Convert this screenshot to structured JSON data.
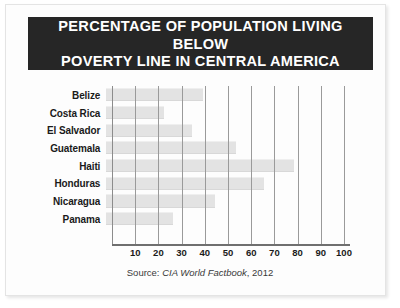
{
  "title": {
    "line1": "PERCENTAGE OF POPULATION LIVING BELOW",
    "line2": "POVERTY LINE IN CENTRAL AMERICA",
    "full": "PERCENTAGE OF POPULATION LIVING BELOW\nPOVERTY LINE IN CENTRAL AMERICA",
    "background_color": "#262626",
    "text_color": "#ffffff"
  },
  "source": {
    "label": "Source: ",
    "publication": "CIA World Factbook",
    "year": ", 2012",
    "full": "Source: CIA World Factbook, 2012"
  },
  "colors": {
    "bar_fill": "#e3e3e3",
    "gridline": "#9a9a9a",
    "axis": "#6f6f6f",
    "page_background": "#fdfdfd",
    "frame_border": "#e4e4e4"
  },
  "chart_data": {
    "type": "bar",
    "orientation": "horizontal",
    "title": "PERCENTAGE OF POPULATION LIVING BELOW POVERTY LINE IN CENTRAL AMERICA",
    "xlabel": "",
    "ylabel": "",
    "categories": [
      "Belize",
      "Costa Rica",
      "El Salvador",
      "Guatemala",
      "Haiti",
      "Honduras",
      "Nicaragua",
      "Panama"
    ],
    "values": [
      42,
      25,
      37,
      56,
      81,
      68,
      47,
      29
    ],
    "xlim": [
      0,
      100
    ],
    "xticks": [
      10,
      20,
      30,
      40,
      50,
      60,
      70,
      80,
      90,
      100
    ],
    "xtick_labels": [
      "10",
      "20",
      "30",
      "40",
      "50",
      "60",
      "70",
      "80",
      "90",
      "100"
    ],
    "grid": true,
    "grid_axis": "x",
    "legend": false,
    "series": [
      {
        "name": "Population below poverty line (%)",
        "values": [
          42,
          25,
          37,
          56,
          81,
          68,
          47,
          29
        ]
      }
    ],
    "bars": [
      {
        "label": "Belize",
        "value": 42
      },
      {
        "label": "Costa Rica",
        "value": 25
      },
      {
        "label": "El Salvador",
        "value": 37
      },
      {
        "label": "Guatemala",
        "value": 56
      },
      {
        "label": "Haiti",
        "value": 81
      },
      {
        "label": "Honduras",
        "value": 68
      },
      {
        "label": "Nicaragua",
        "value": 47
      },
      {
        "label": "Panama",
        "value": 29
      }
    ]
  }
}
